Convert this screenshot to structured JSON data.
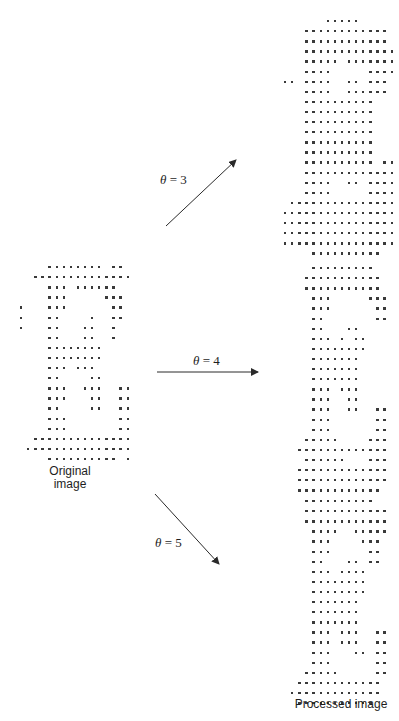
{
  "figure": {
    "original_label_line1": "Original",
    "original_label_line2": "image",
    "processed_label": "Processed image",
    "arrows": [
      {
        "symbol": "θ",
        "eq": " = 3",
        "value": 3,
        "direction": "up-right"
      },
      {
        "symbol": "θ",
        "eq": " = 4",
        "value": 4,
        "direction": "right"
      },
      {
        "symbol": "θ",
        "eq": " = 5",
        "value": 5,
        "direction": "down-right"
      }
    ],
    "dot_color": "#3a3a3a",
    "arrow_color": "#2a2a2a"
  },
  "images": {
    "original": {
      "x": 20,
      "y": 266,
      "dx": 7.1,
      "dy": 10.1,
      "rows": [
        "000.......0.0",
        "00...........0",
        "000...000....0",
        "000..000000..0",
        ".00.0000000...",
        "..00000000....",
        "x..00.000.0000",
        "x..00.00000000",
        "x..00.00000000",
        "...00.000.0000",
        "...00....0000.",
        "...000...00000",
        "...000...00000",
        "...00....00000",
        "...00.000.00.0",
        "...000...0000.",
        "...000...0000.",
        ".00...........",
        "..............",
        "...........0.0"
      ]
    },
    "theta3": {
      "x": 287,
      "y": 20,
      "dx": 7.1,
      "dy": 10.1
    },
    "theta4": {
      "x": 287,
      "y": 267,
      "dx": 7.1,
      "dy": 10.1
    },
    "theta5": {
      "x": 287,
      "y": 500,
      "dx": 7.1,
      "dy": 10.1
    }
  }
}
